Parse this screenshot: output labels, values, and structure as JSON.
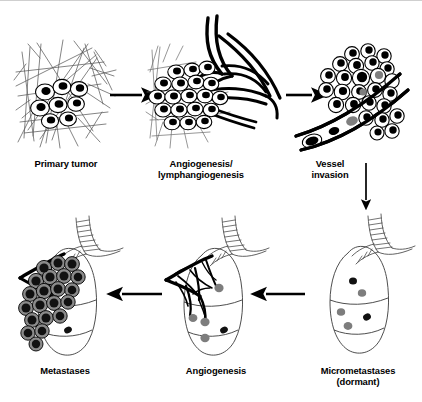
{
  "figure": {
    "background_color": "#ffffff",
    "stroke_color": "#000000",
    "nucleus_color": "#000000",
    "grey_fill": "#808080",
    "stroma_color": "#555555"
  },
  "panels": [
    {
      "id": "primary-tumor",
      "label": "Primary tumor",
      "stage": 1,
      "description": "Tumor cell cluster embedded in stromal fiber network",
      "cell_count": 8,
      "cell_style": "white ellipse with black nucleus"
    },
    {
      "id": "angiogenesis-lymphangiogenesis",
      "label": "Angiogenesis/\nlymphangiogenesis",
      "stage": 2,
      "description": "Expanded tumor mass with new vessel branches growing in",
      "cell_count": 19,
      "cell_style": "white ellipse with black nucleus"
    },
    {
      "id": "vessel-invasion",
      "label": "Vessel\ninvasion",
      "stage": 3,
      "description": "Tumor cells intravasating into a blood vessel lumen",
      "cell_count": 26,
      "cell_style": "white circle with black nucleus"
    },
    {
      "id": "micrometastases-dormant",
      "label": "Micrometastases\n(dormant)",
      "stage": 4,
      "description": "Lung with a few dormant avascular micrometastatic foci",
      "nodule_count": 5,
      "cell_style": "small grey and black dots"
    },
    {
      "id": "angiogenesis-lung",
      "label": "Angiogenesis",
      "stage": 5,
      "description": "Lung micrometastases recruiting a new vascular tree",
      "nodule_count": 5,
      "cell_style": "grey nodules with black vessel tree"
    },
    {
      "id": "metastases",
      "label": "Metastases",
      "stage": 6,
      "description": "Lung replaced by large vascularized metastatic nodules",
      "nodule_count": 21,
      "cell_style": "grey nodule with black core"
    }
  ],
  "arrows": [
    {
      "id": "arrow-1",
      "from": "primary-tumor",
      "to": "angiogenesis-lymphangiogenesis",
      "direction": "right"
    },
    {
      "id": "arrow-2",
      "from": "angiogenesis-lymphangiogenesis",
      "to": "vessel-invasion",
      "direction": "right"
    },
    {
      "id": "arrow-3",
      "from": "vessel-invasion",
      "to": "micrometastases-dormant",
      "direction": "down"
    },
    {
      "id": "arrow-4",
      "from": "micrometastases-dormant",
      "to": "angiogenesis-lung",
      "direction": "left"
    },
    {
      "id": "arrow-5",
      "from": "angiogenesis-lung",
      "to": "metastases",
      "direction": "left"
    }
  ]
}
